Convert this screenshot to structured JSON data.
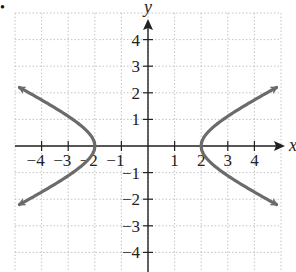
{
  "bullet": "•",
  "chart_data": {
    "type": "line",
    "title": "",
    "xlabel": "x",
    "ylabel": "y",
    "xlim": [
      -5,
      5
    ],
    "ylim": [
      -5,
      5
    ],
    "grid": true,
    "x_ticks": [
      -4,
      -3,
      -2,
      -1,
      1,
      2,
      3,
      4
    ],
    "y_ticks": [
      -4,
      -3,
      -2,
      -1,
      1,
      2,
      3,
      4
    ],
    "x_tick_labels": [
      "−4",
      "−3",
      "−2",
      "−1",
      "1",
      "2",
      "3",
      "4"
    ],
    "y_tick_labels": [
      "−4",
      "−3",
      "−2",
      "−1",
      "1",
      "2",
      "3",
      "4"
    ],
    "equation": "x^2/4 - y^2 = 1",
    "series": [
      {
        "name": "left branch",
        "color": "#6b6b6b",
        "points": [
          [
            -4.9,
            2.2
          ],
          [
            -4,
            1.73
          ],
          [
            -3,
            1.12
          ],
          [
            -2.5,
            0.75
          ],
          [
            -2.2,
            0.46
          ],
          [
            -2,
            0
          ],
          [
            -2.2,
            -0.46
          ],
          [
            -2.5,
            -0.75
          ],
          [
            -3,
            -1.12
          ],
          [
            -4,
            -1.73
          ],
          [
            -4.9,
            -2.2
          ]
        ],
        "arrows": "both ends"
      },
      {
        "name": "right branch",
        "color": "#6b6b6b",
        "points": [
          [
            4.9,
            2.2
          ],
          [
            4,
            1.73
          ],
          [
            3,
            1.12
          ],
          [
            2.5,
            0.75
          ],
          [
            2.2,
            0.46
          ],
          [
            2,
            0
          ],
          [
            2.2,
            -0.46
          ],
          [
            2.5,
            -0.75
          ],
          [
            3,
            -1.12
          ],
          [
            4,
            -1.73
          ],
          [
            4.9,
            -2.2
          ]
        ],
        "arrows": "both ends"
      }
    ]
  }
}
